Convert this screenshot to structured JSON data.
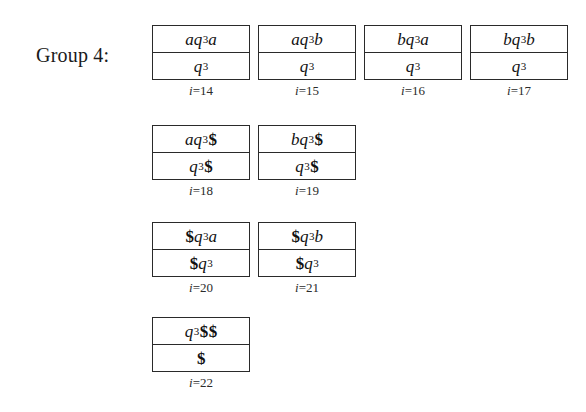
{
  "figure": {
    "group_label": "Group 4:",
    "background_color": "#ffffff",
    "line_color": "#2a2a2a",
    "text_color": "#161616",
    "rows": [
      {
        "units": [
          {
            "top": "aq₃3a",
            "bottom": "q₃3",
            "caption": "i=14",
            "index": "14"
          },
          {
            "top": "aq₃3b",
            "bottom": "q₃3",
            "caption": "i=15",
            "index": "15"
          },
          {
            "top": "bq₃3a",
            "bottom": "q₃3",
            "caption": "i=16",
            "index": "16"
          },
          {
            "top": "bq₃3b",
            "bottom": "q₃3",
            "caption": "i=17",
            "index": "17"
          }
        ]
      },
      {
        "units": [
          {
            "top": "aq₃3$",
            "bottom": "q₃3$",
            "caption": "i=18",
            "index": "18"
          },
          {
            "top": "bq₃3$",
            "bottom": "q₃3$",
            "caption": "i=19",
            "index": "19"
          }
        ]
      },
      {
        "units": [
          {
            "top": "$q₃3a",
            "bottom": "$q₃3",
            "caption": "i=20",
            "index": "20"
          },
          {
            "top": "$q₃3b",
            "bottom": "$q₃3",
            "caption": "i=21",
            "index": "21"
          }
        ]
      },
      {
        "units": [
          {
            "top": "q₃3$$",
            "bottom": "$",
            "caption": "i=22",
            "index": "22"
          }
        ]
      }
    ]
  },
  "cells": {
    "r1c1_top": "aq3a",
    "r1c1_bottom": "q3",
    "r1c1_caption": "i=14",
    "r1c2_top": "aq3b",
    "r1c2_bottom": "q3",
    "r1c2_caption": "i=15",
    "r1c3_top": "bq3a",
    "r1c3_bottom": "q3",
    "r1c3_caption": "i=16",
    "r1c4_top": "bq3b",
    "r1c4_bottom": "q3",
    "r1c4_caption": "i=17",
    "r2c1_top": "aq3$",
    "r2c1_bottom": "q3$",
    "r2c1_caption": "i=18",
    "r2c2_top": "bq3$",
    "r2c2_bottom": "q3$",
    "r2c2_caption": "i=19",
    "r3c1_top": "$q3a",
    "r3c1_bottom": "$q3",
    "r3c1_caption": "i=20",
    "r3c2_top": "$q3b",
    "r3c2_bottom": "$q3",
    "r3c2_caption": "i=21",
    "r4c1_top": "q3$$",
    "r4c1_bottom": "$",
    "r4c1_caption": "i=22"
  },
  "symbols": {
    "state": "q",
    "state_subscript": "3",
    "letter_a": "a",
    "letter_b": "b",
    "endmarker": "$",
    "index_var": "i",
    "equals": "="
  }
}
